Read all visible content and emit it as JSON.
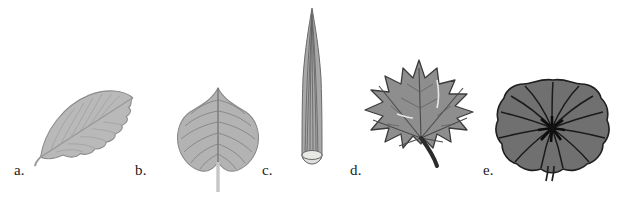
{
  "figure": {
    "background_color": "#ffffff",
    "width": 628,
    "height": 198,
    "caption": ""
  },
  "specimens": [
    {
      "label": "a.",
      "name": "serrate-elliptic-leaf",
      "description": "elliptic leaf with serrated margin and pinnate venation, tilted",
      "fill_color": "#b9b9b9",
      "stroke_color": "#8d8d8d",
      "vein_color": "#9a9a9a",
      "label_x": 14,
      "label_y": 170
    },
    {
      "label": "b.",
      "name": "cordate-leaf",
      "description": "heart-shaped cordate leaf with long pale petiole",
      "fill_color": "#b3b3b3",
      "stroke_color": "#8a8a8a",
      "vein_color": "#6f6f6f",
      "label_x": 135,
      "label_y": 170
    },
    {
      "label": "c.",
      "name": "needle-linear-leaf",
      "description": "tall narrow needle-like linear leaf with parallel striations and cut base",
      "fill_color": "#a8a8a8",
      "stroke_color": "#6a6a6a",
      "vein_color": "#5e5e5e",
      "label_x": 262,
      "label_y": 170
    },
    {
      "label": "d.",
      "name": "palmate-lobed-maple-leaf",
      "description": "palmately lobed maple-like leaf with five lobes and dark curved petiole",
      "fill_color": "#8e8e8e",
      "stroke_color": "#3c3c3c",
      "vein_color": "#4a4a4a",
      "label_x": 350,
      "label_y": 170
    },
    {
      "label": "e.",
      "name": "orbicular-peltate-leaf",
      "description": "round peltate leaf with scalloped margin and radiating veins from central hub",
      "fill_color": "#707070",
      "stroke_color": "#1f1f1f",
      "vein_color": "#1a1a1a",
      "label_x": 483,
      "label_y": 170
    }
  ]
}
